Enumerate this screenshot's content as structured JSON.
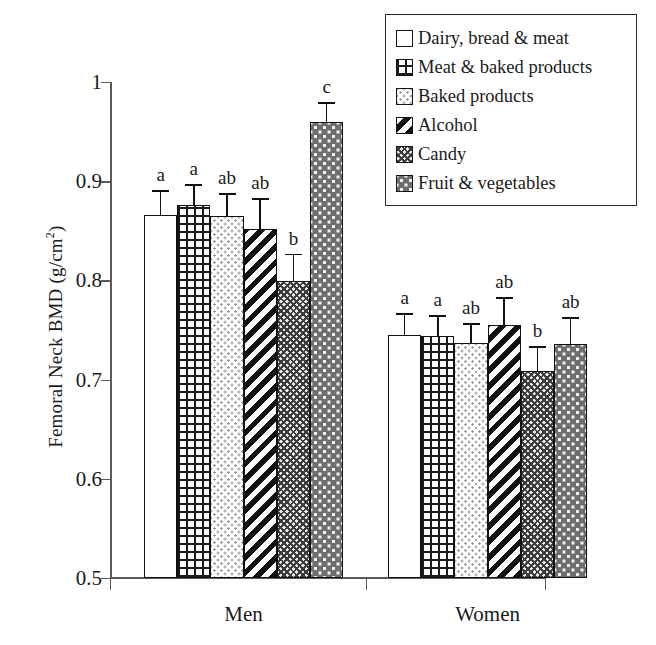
{
  "chart_data": {
    "type": "bar",
    "title": "",
    "xlabel": "",
    "ylabel": "Femoral Neck BMD (g/cm2)",
    "ylabel_base": "Femoral Neck BMD (g/cm",
    "ylabel_sup": "2",
    "ylabel_tail": ")",
    "categories": [
      "Men",
      "Women"
    ],
    "ylim": [
      0.5,
      1.0
    ],
    "yticks": [
      "0.5",
      "0.6",
      "0.7",
      "0.8",
      "0.9",
      "1"
    ],
    "ytick_values": [
      0.5,
      0.6,
      0.7,
      0.8,
      0.9,
      1.0
    ],
    "grid": false,
    "legend_position": "top-right",
    "series": [
      {
        "name": "Dairy, bread & meat",
        "pattern": "plain-white",
        "values": [
          0.866,
          0.745
        ],
        "errors_upper": [
          0.891,
          0.767
        ],
        "sig_letters": [
          "a",
          "a"
        ]
      },
      {
        "name": "Meat & baked products",
        "pattern": "dark-grid",
        "values": [
          0.876,
          0.744
        ],
        "errors_upper": [
          0.897,
          0.765
        ],
        "sig_letters": [
          "a",
          "a"
        ]
      },
      {
        "name": "Baked products",
        "pattern": "light-dots",
        "values": [
          0.865,
          0.737
        ],
        "errors_upper": [
          0.888,
          0.757
        ],
        "sig_letters": [
          "ab",
          "ab"
        ]
      },
      {
        "name": "Alcohol",
        "pattern": "diagonal-stripes",
        "values": [
          0.852,
          0.755
        ],
        "errors_upper": [
          0.883,
          0.783
        ],
        "sig_letters": [
          "ab",
          "ab"
        ]
      },
      {
        "name": "Candy",
        "pattern": "dense-checker",
        "values": [
          0.799,
          0.709
        ],
        "errors_upper": [
          0.827,
          0.734
        ],
        "sig_letters": [
          "b",
          "b"
        ]
      },
      {
        "name": "Fruit & vegetables",
        "pattern": "dark-dots",
        "values": [
          0.96,
          0.736
        ],
        "errors_upper": [
          0.98,
          0.763
        ],
        "sig_letters": [
          "c",
          "ab"
        ]
      }
    ],
    "colors": {
      "axis": "#5a5a5a",
      "bar_outline": "#111111",
      "error_bar": "#111111",
      "background": "#ffffff",
      "legend_border": "#2b2b2b"
    }
  },
  "legend": {
    "items": [
      {
        "label": "Dairy, bread & meat",
        "pattern": "plain-white"
      },
      {
        "label": "Meat & baked products",
        "pattern": "dark-grid"
      },
      {
        "label": "Baked products",
        "pattern": "light-dots"
      },
      {
        "label": "Alcohol",
        "pattern": "diagonal-stripes"
      },
      {
        "label": "Candy",
        "pattern": "dense-checker"
      },
      {
        "label": "Fruit & vegetables",
        "pattern": "dark-dots"
      }
    ]
  }
}
